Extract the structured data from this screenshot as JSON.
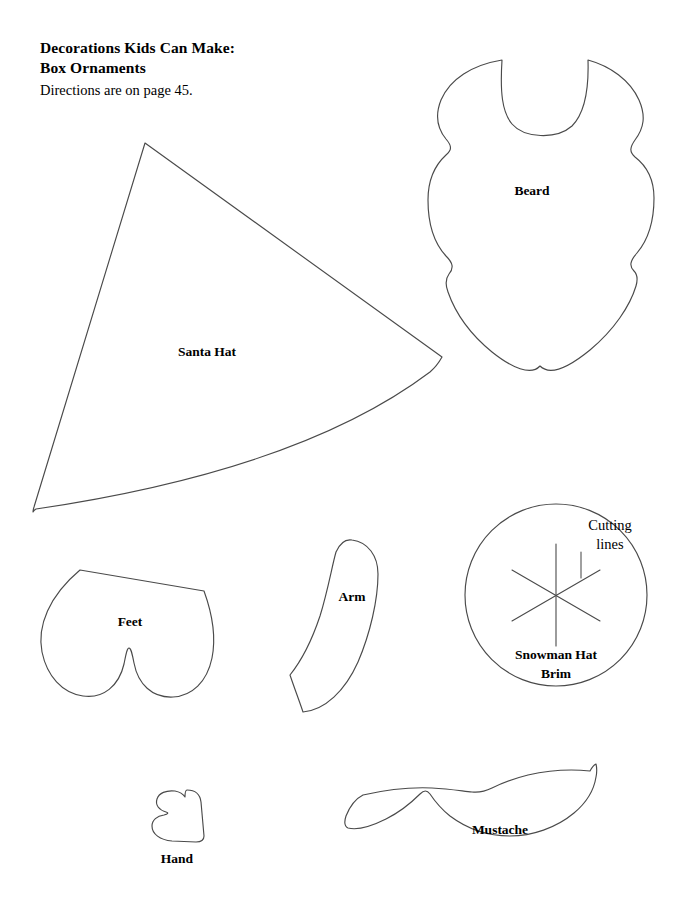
{
  "page": {
    "width": 692,
    "height": 906,
    "background_color": "#ffffff",
    "stroke_color": "#4a4a4a",
    "text_color": "#000000"
  },
  "header": {
    "title_line1": "Decorations Kids Can Make:",
    "title_line2": "Box Ornaments",
    "subtitle": "Directions are on page 45."
  },
  "shapes": {
    "santa_hat": {
      "label": "Santa Hat"
    },
    "beard": {
      "label": "Beard"
    },
    "feet": {
      "label": "Feet"
    },
    "arm": {
      "label": "Arm"
    },
    "snowman_hat_brim": {
      "label_line1": "Snowman Hat",
      "label_line2": "Brim",
      "annotation_line1": "Cutting",
      "annotation_line2": "lines"
    },
    "hand": {
      "label": "Hand"
    },
    "mustache": {
      "label": "Mustache"
    }
  }
}
